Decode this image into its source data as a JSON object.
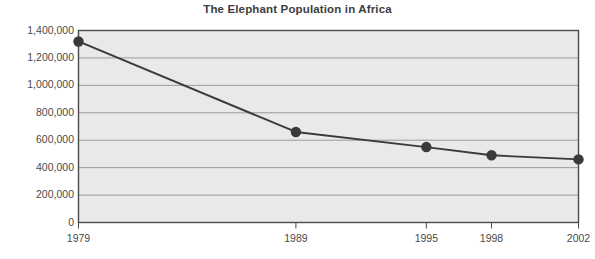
{
  "chart_data": {
    "type": "line",
    "title": "The Elephant Population in Africa",
    "xlabel": "",
    "ylabel": "",
    "x": [
      1979,
      1989,
      1995,
      1998,
      2002
    ],
    "categories": [
      "1979",
      "1989",
      "1995",
      "1998",
      "2002"
    ],
    "values": [
      1320000,
      660000,
      550000,
      490000,
      460000
    ],
    "series": [
      {
        "name": "Elephant population",
        "values": [
          1320000,
          660000,
          550000,
          490000,
          460000
        ]
      }
    ],
    "ylim": [
      0,
      1400000
    ],
    "ytick_values": [
      0,
      200000,
      400000,
      600000,
      800000,
      1000000,
      1200000,
      1400000
    ],
    "ytick_labels": [
      "0",
      "200,000",
      "400,000",
      "600,000",
      "800,000",
      "1,000,000",
      "1,200,000",
      "1,400,000"
    ],
    "xtick_labels": [
      "1979",
      "1989",
      "1995",
      "1998",
      "2002"
    ],
    "grid": "horizontal",
    "legend": "none",
    "marker": "filled-circle",
    "colors": {
      "line": "#3a3a3a",
      "marker": "#3a3a3a",
      "plot_background": "#e9e9e9",
      "plot_border": "#4a4a4a",
      "gridline": "#9a9a9a",
      "title_text": "#3d3d3d",
      "tick_text": "#4a4a4a",
      "page_background": "#ffffff"
    }
  }
}
